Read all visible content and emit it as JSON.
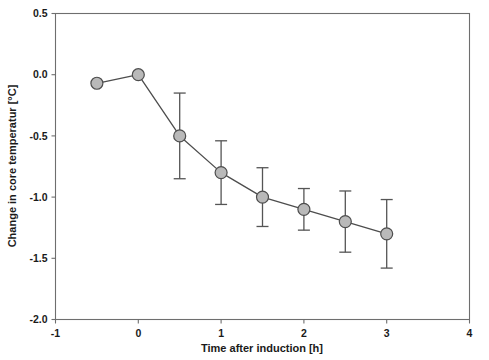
{
  "chart_data": {
    "type": "line",
    "title": "",
    "subtitle": "",
    "xlabel": "Time after induction [h]",
    "ylabel": "Change in core temperatur [°C]",
    "xlim": [
      -1,
      4
    ],
    "ylim": [
      -2.0,
      0.5
    ],
    "xticks": [
      -1,
      0,
      1,
      2,
      3,
      4
    ],
    "xtick_labels": [
      "-1",
      "0",
      "1",
      "2",
      "3",
      "4"
    ],
    "yticks": [
      0.5,
      0.0,
      -0.5,
      -1.0,
      -1.5,
      -2.0
    ],
    "ytick_labels": [
      "0.5",
      "0.0",
      "-0.5",
      "-1.0",
      "-1.5",
      "-2.0"
    ],
    "grid": false,
    "legend": null,
    "marker": {
      "shape": "circle",
      "fill_color": "#b9b9b9",
      "edge_color": "#4d4d4d",
      "radius_px": 6
    },
    "line_color": "#4d4d4d",
    "error_color": "#555555",
    "error_type": "standard deviation",
    "series": [
      {
        "name": "Core temperature change",
        "x": [
          -0.5,
          0.0,
          0.5,
          1.0,
          1.5,
          2.0,
          2.5,
          3.0
        ],
        "values": [
          -0.07,
          0.0,
          -0.5,
          -0.8,
          -1.0,
          -1.1,
          -1.2,
          -1.3
        ],
        "errors": [
          null,
          null,
          0.35,
          0.26,
          0.24,
          0.17,
          0.25,
          0.28
        ]
      }
    ],
    "points": [
      {
        "x": -0.5,
        "y": -0.07,
        "err": null
      },
      {
        "x": 0.0,
        "y": 0.0,
        "err": null
      },
      {
        "x": 0.5,
        "y": -0.5,
        "err": 0.35
      },
      {
        "x": 1.0,
        "y": -0.8,
        "err": 0.26
      },
      {
        "x": 1.5,
        "y": -1.0,
        "err": 0.24
      },
      {
        "x": 2.0,
        "y": -1.1,
        "err": 0.17
      },
      {
        "x": 2.5,
        "y": -1.2,
        "err": 0.25
      },
      {
        "x": 3.0,
        "y": -1.3,
        "err": 0.28
      }
    ],
    "annotations": []
  }
}
